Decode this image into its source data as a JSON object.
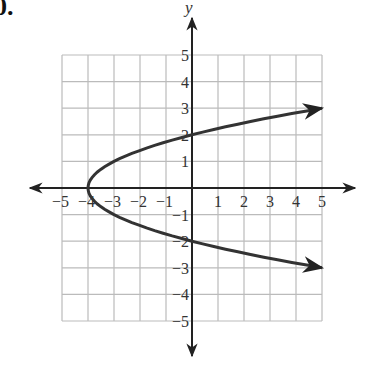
{
  "problem_number": "0.",
  "chart_data": {
    "type": "line",
    "title": "",
    "xlabel": "",
    "ylabel": "y",
    "xlim": [
      -5,
      5
    ],
    "ylim": [
      -5,
      5
    ],
    "grid": true,
    "x_ticks": [
      "-5",
      "-4",
      "-3",
      "-2",
      "-1",
      "1",
      "2",
      "3",
      "4",
      "5"
    ],
    "y_ticks": [
      "5",
      "4",
      "3",
      "2",
      "1",
      "-1",
      "-2",
      "-3",
      "-4",
      "-5"
    ],
    "series": [
      {
        "name": "x = y^2 - 4 (parabola opening right)",
        "equation": "x = y^2 - 4",
        "vertex": [
          -4,
          0
        ],
        "x_intercept": -4,
        "y_intercepts": [
          2,
          -2
        ],
        "points": [
          [
            5,
            3
          ],
          [
            0,
            2
          ],
          [
            -3,
            1
          ],
          [
            -4,
            0
          ],
          [
            -3,
            -1
          ],
          [
            0,
            -2
          ],
          [
            5,
            -3
          ]
        ],
        "arrows_at_ends": true
      }
    ],
    "colors": {
      "curve": "#333333",
      "axes": "#222222",
      "grid": "#bbbbbb"
    }
  }
}
